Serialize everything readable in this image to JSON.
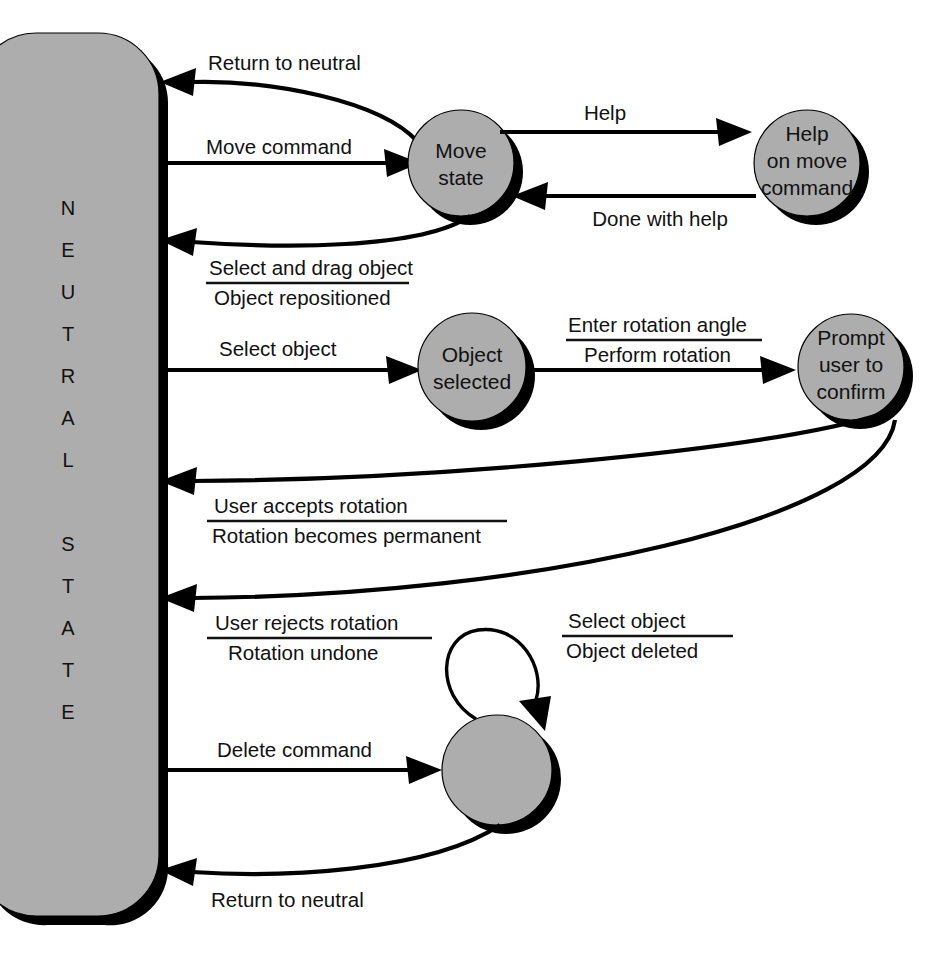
{
  "diagram": {
    "background_color": "#ffffff",
    "state_fill_color": "#adadad",
    "stroke_color": "#000000",
    "shadow_color": "#000000"
  },
  "neutral_state": {
    "label": "NEUTRAL STATE",
    "letters": [
      "N",
      "E",
      "U",
      "T",
      "R",
      "A",
      "L",
      "",
      "S",
      "T",
      "A",
      "T",
      "E"
    ]
  },
  "states": [
    {
      "id": "move",
      "label_lines": [
        "Move",
        "state"
      ]
    },
    {
      "id": "help_move",
      "label_lines": [
        "Help",
        "on move",
        "command"
      ]
    },
    {
      "id": "object_selected",
      "label_lines": [
        "Object",
        "selected"
      ]
    },
    {
      "id": "prompt_confirm",
      "label_lines": [
        "Prompt",
        "user to",
        "confirm"
      ]
    },
    {
      "id": "delete_state",
      "label_lines": []
    }
  ],
  "transitions": [
    {
      "id": "t_return_neutral_move",
      "from": "move",
      "to": "neutral",
      "event": "Return to neutral",
      "action": "",
      "has_fraction": false
    },
    {
      "id": "t_move_command",
      "from": "neutral",
      "to": "move",
      "event": "Move command",
      "action": "",
      "has_fraction": false
    },
    {
      "id": "t_help",
      "from": "move",
      "to": "help_move",
      "event": "Help",
      "action": "",
      "has_fraction": false
    },
    {
      "id": "t_done_with_help",
      "from": "help_move",
      "to": "move",
      "event": "Done with help",
      "action": "",
      "has_fraction": false
    },
    {
      "id": "t_select_drag",
      "from": "move",
      "to": "neutral",
      "event": "Select and drag object",
      "action": "Object repositioned",
      "has_fraction": true
    },
    {
      "id": "t_select_object",
      "from": "neutral",
      "to": "object_selected",
      "event": "Select object",
      "action": "",
      "has_fraction": false
    },
    {
      "id": "t_enter_rotation",
      "from": "object_selected",
      "to": "prompt_confirm",
      "event": "Enter rotation angle",
      "action": "Perform rotation",
      "has_fraction": true
    },
    {
      "id": "t_accept_rotation",
      "from": "prompt_confirm",
      "to": "neutral",
      "event": "User accepts rotation",
      "action": "Rotation becomes permanent",
      "has_fraction": true
    },
    {
      "id": "t_reject_rotation",
      "from": "prompt_confirm",
      "to": "neutral",
      "event": "User rejects rotation",
      "action": "Rotation undone",
      "has_fraction": true
    },
    {
      "id": "t_delete_self_loop",
      "from": "delete_state",
      "to": "delete_state",
      "event": "Select object",
      "action": "Object deleted",
      "has_fraction": true
    },
    {
      "id": "t_delete_command",
      "from": "neutral",
      "to": "delete_state",
      "event": "Delete command",
      "action": "",
      "has_fraction": false
    },
    {
      "id": "t_return_neutral_delete",
      "from": "delete_state",
      "to": "neutral",
      "event": "Return to neutral",
      "action": "",
      "has_fraction": false
    }
  ]
}
